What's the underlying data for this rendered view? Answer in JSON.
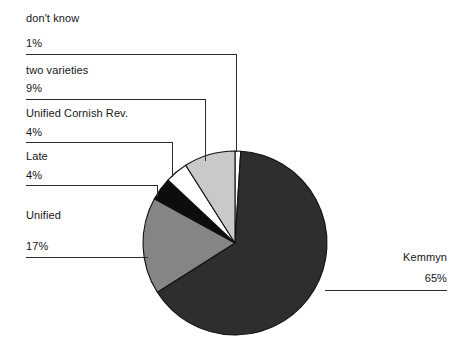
{
  "chart_data": {
    "type": "pie",
    "title": "",
    "subtitle": "",
    "xlabel": "",
    "ylabel": "",
    "legend_position": "none",
    "grid": false,
    "start_angle_deg": 0,
    "direction": "clockwise",
    "categories": [
      "don't know",
      "Kemmyn",
      "Unified",
      "Late",
      "Unified Cornish Rev.",
      "two varieties"
    ],
    "values": [
      1,
      65,
      17,
      4,
      4,
      9
    ],
    "value_suffix": "%",
    "slice_colors": [
      "#ffffff",
      "#2e2e2e",
      "#858585",
      "#0d0d0d",
      "#ffffff",
      "#c9c9c9"
    ],
    "slices": [
      {
        "name": "dont-know",
        "label": "don't know",
        "percent": "1%",
        "value": 1,
        "color": "#ffffff"
      },
      {
        "name": "kemmyn",
        "label": "Kemmyn",
        "percent": "65%",
        "value": 65,
        "color": "#2e2e2e"
      },
      {
        "name": "unified",
        "label": "Unified",
        "percent": "17%",
        "value": 17,
        "color": "#858585"
      },
      {
        "name": "late",
        "label": "Late",
        "percent": "4%",
        "value": 4,
        "color": "#0d0d0d"
      },
      {
        "name": "unified-cornish-rev",
        "label": "Unified Cornish Rev.",
        "percent": "4%",
        "value": 4,
        "color": "#ffffff"
      },
      {
        "name": "two-varieties",
        "label": "two varieties",
        "percent": "9%",
        "value": 9,
        "color": "#c9c9c9"
      }
    ]
  },
  "labels": {
    "dont_know_name": "don't know",
    "dont_know_pct": "1%",
    "two_varieties_name": "two varieties",
    "two_varieties_pct": "9%",
    "ucr_name": "Unified Cornish Rev.",
    "ucr_pct": "4%",
    "late_name": "Late",
    "late_pct": "4%",
    "unified_name": "Unified",
    "unified_pct": "17%",
    "kemmyn_name": "Kemmyn",
    "kemmyn_pct": "65%"
  },
  "colors": {
    "background": "#ffffff",
    "text": "#161616",
    "leader_line": "#2b2b2b",
    "slice_outline": "#111111"
  }
}
